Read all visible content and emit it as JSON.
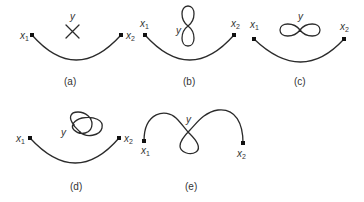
{
  "figure": {
    "panels": [
      {
        "id": "a",
        "caption": "(a)",
        "start_label": "x",
        "start_sub": "1",
        "end_label": "x",
        "end_sub": "2",
        "y_label": "y",
        "y_shape": "crossing point (X)"
      },
      {
        "id": "b",
        "caption": "(b)",
        "start_label": "x",
        "start_sub": "1",
        "end_label": "x",
        "end_sub": "2",
        "y_label": "y",
        "y_shape": "vertical figure-eight"
      },
      {
        "id": "c",
        "caption": "(c)",
        "start_label": "x",
        "start_sub": "1",
        "end_label": "x",
        "end_sub": "2",
        "y_label": "y",
        "y_shape": "horizontal figure-eight (infinity)"
      },
      {
        "id": "d",
        "caption": "(d)",
        "start_label": "x",
        "start_sub": "1",
        "end_label": "x",
        "end_sub": "2",
        "y_label": "y",
        "y_shape": "knotted loop"
      },
      {
        "id": "e",
        "caption": "(e)",
        "start_label": "x",
        "start_sub": "1",
        "end_label": "x",
        "end_sub": "2",
        "y_label": "y",
        "y_shape": "path with self-intersecting loop at y"
      }
    ]
  }
}
